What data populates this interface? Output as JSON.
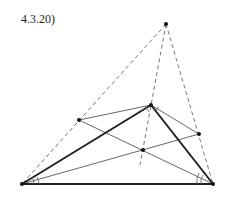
{
  "figure": {
    "label": "4.3.20)"
  },
  "points": {
    "A": [
      22,
      184
    ],
    "C": [
      213,
      184
    ],
    "B": [
      151,
      105
    ],
    "P_apex": [
      166,
      24
    ],
    "Q_left": [
      79,
      120
    ],
    "R_right": [
      199,
      134
    ],
    "O_center": [
      143,
      150
    ]
  },
  "colors": {
    "thick": "#222222",
    "thin": "#555555",
    "dashed": "#777777",
    "point": "#111111"
  }
}
